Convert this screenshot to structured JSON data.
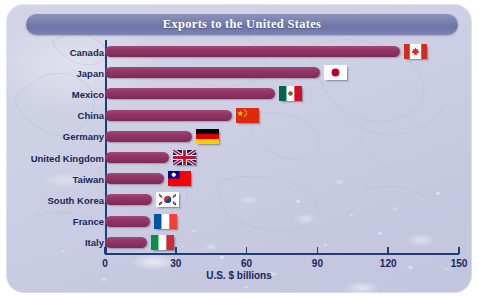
{
  "title": "Exports to the United States",
  "chart_data": {
    "type": "bar",
    "orientation": "horizontal",
    "title": "Exports to the United States",
    "xlabel": "U.S. $ billions",
    "ylabel": "",
    "xlim": [
      0,
      150
    ],
    "xticks": [
      0,
      30,
      60,
      90,
      120,
      150
    ],
    "xtick_labels": [
      "0",
      "30",
      "60",
      "90",
      "120",
      "150"
    ],
    "grid": false,
    "legend": "none",
    "bar_color": "#8b3160",
    "categories": [
      "Canada",
      "Japan",
      "Mexico",
      "China",
      "Germany",
      "United Kingdom",
      "Taiwan",
      "South Korea",
      "France",
      "Italy"
    ],
    "values": [
      125,
      91,
      72,
      54,
      37,
      27,
      25,
      20,
      19,
      18
    ],
    "series": [
      {
        "name": "Exports to the United States",
        "values": [
          125,
          91,
          72,
          54,
          37,
          27,
          25,
          20,
          19,
          18
        ]
      }
    ],
    "points": [
      {
        "country": "Canada",
        "flag": "flag-canada",
        "value": 125
      },
      {
        "country": "Japan",
        "flag": "flag-japan",
        "value": 91
      },
      {
        "country": "Mexico",
        "flag": "flag-mexico",
        "value": 72
      },
      {
        "country": "China",
        "flag": "flag-china",
        "value": 54
      },
      {
        "country": "Germany",
        "flag": "flag-germany",
        "value": 37
      },
      {
        "country": "United Kingdom",
        "flag": "flag-united-kingdom",
        "value": 27
      },
      {
        "country": "Taiwan",
        "flag": "flag-taiwan",
        "value": 25
      },
      {
        "country": "South Korea",
        "flag": "flag-south-korea",
        "value": 20
      },
      {
        "country": "France",
        "flag": "flag-france",
        "value": 19
      },
      {
        "country": "Italy",
        "flag": "flag-italy",
        "value": 18
      }
    ]
  },
  "colors": {
    "bar": "#8b3160",
    "axis": "#1f3f7a",
    "label_text": "#1b2656",
    "title_bar": "#787ead",
    "title_text": "#ffffff",
    "background": "#cdd0e4"
  }
}
